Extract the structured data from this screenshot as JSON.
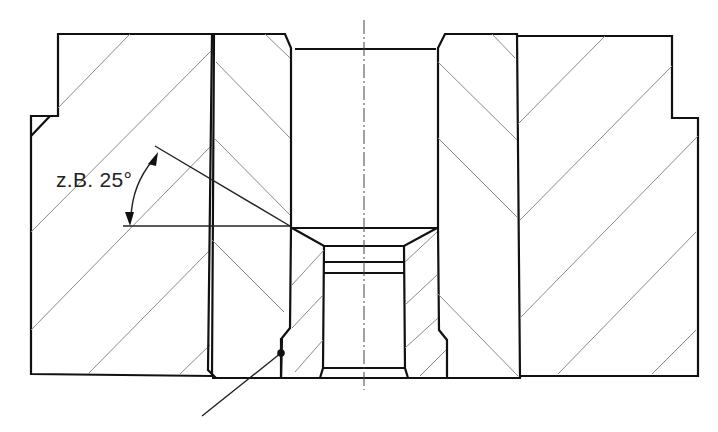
{
  "figure": {
    "type": "technical-cross-section",
    "annotation": {
      "angle_label": "z.B. 25°"
    },
    "colors": {
      "outline": "#111111",
      "hatch": "#8a8a8a",
      "background": "#ffffff"
    }
  }
}
